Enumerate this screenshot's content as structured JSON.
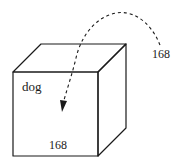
{
  "diagram": {
    "type": "cube-with-arrow",
    "cube": {
      "front_label": "dog",
      "front_value": "168"
    },
    "arrow": {
      "style": "dashed-curved",
      "source_label": "168"
    },
    "colors": {
      "stroke": "#1a1a1a",
      "background": "#ffffff"
    }
  }
}
